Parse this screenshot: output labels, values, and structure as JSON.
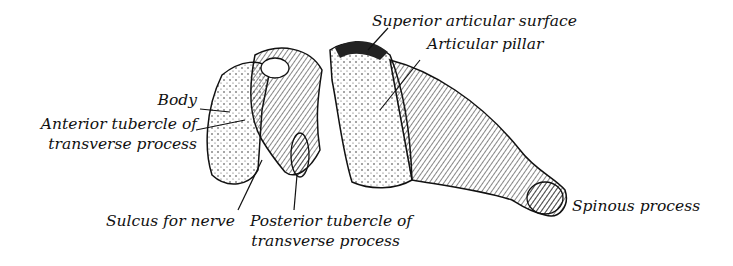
{
  "figure": {
    "labels": {
      "superior_articular_surface": "Superior articular surface",
      "articular_pillar": "Articular pillar",
      "body": "Body",
      "anterior_tubercle_line1": "Anterior tubercle of",
      "anterior_tubercle_line2": "transverse process",
      "sulcus_for_nerve": "Sulcus for nerve",
      "posterior_tubercle_line1": "Posterior tubercle of",
      "posterior_tubercle_line2": "transverse process",
      "spinous_process": "Spinous process"
    }
  }
}
